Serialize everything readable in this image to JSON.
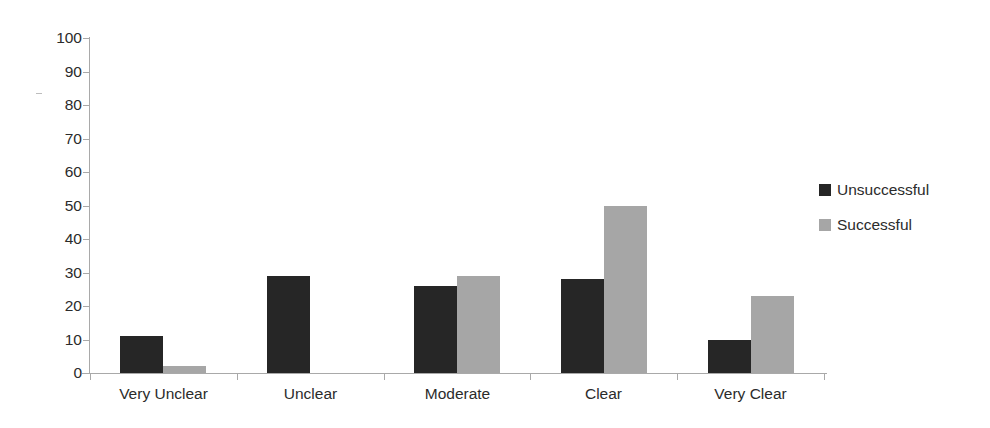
{
  "chart_data": {
    "type": "bar",
    "title": "",
    "subtitle": "",
    "xlabel": "",
    "ylabel": "",
    "categories": [
      "Very Unclear",
      "Unclear",
      "Moderate",
      "Clear",
      "Very Clear"
    ],
    "series": [
      {
        "name": "Unsuccessful",
        "color": "#262626",
        "values": [
          11,
          29,
          26,
          28,
          10
        ]
      },
      {
        "name": "Successful",
        "color": "#a6a6a6",
        "values": [
          2,
          0,
          29,
          50,
          23
        ]
      }
    ],
    "ylim": [
      0,
      100
    ],
    "ytick_step": 10,
    "ytick_labels": [
      "100",
      "90",
      "80",
      "70",
      "60",
      "50",
      "40",
      "30",
      "20",
      "10",
      "0"
    ],
    "grid": false,
    "legend_position": "right",
    "annotations": []
  },
  "legend": {
    "entries": [
      {
        "label": "Unsuccessful",
        "swatch": "dark-square-swatch"
      },
      {
        "label": "Successful",
        "swatch": "gray-square-swatch"
      }
    ]
  }
}
